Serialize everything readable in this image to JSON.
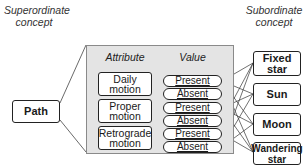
{
  "left_caption": {
    "line1": "Superordinate",
    "line2": "concept"
  },
  "right_caption": {
    "line1": "Subordinate",
    "line2": "concept"
  },
  "superordinate": {
    "label": "Path"
  },
  "panel": {
    "attribute_header": "Attribute",
    "value_header": "Value",
    "attributes": [
      {
        "line1": "Daily",
        "line2": "motion",
        "values": [
          "Present",
          "Absent"
        ]
      },
      {
        "line1": "Proper",
        "line2": "motion",
        "values": [
          "Present",
          "Absent"
        ]
      },
      {
        "line1": "Retrograde",
        "line2": "motion",
        "values": [
          "Present",
          "Absent"
        ]
      }
    ]
  },
  "subordinates": [
    {
      "line1": "Fixed",
      "line2": "star"
    },
    {
      "line1": "Sun",
      "line2": ""
    },
    {
      "line1": "Moon",
      "line2": ""
    },
    {
      "line1": "Wandering",
      "line2": "star"
    }
  ],
  "colors": {
    "panel_bg": "#e4e4e4",
    "stroke": "#222222"
  }
}
